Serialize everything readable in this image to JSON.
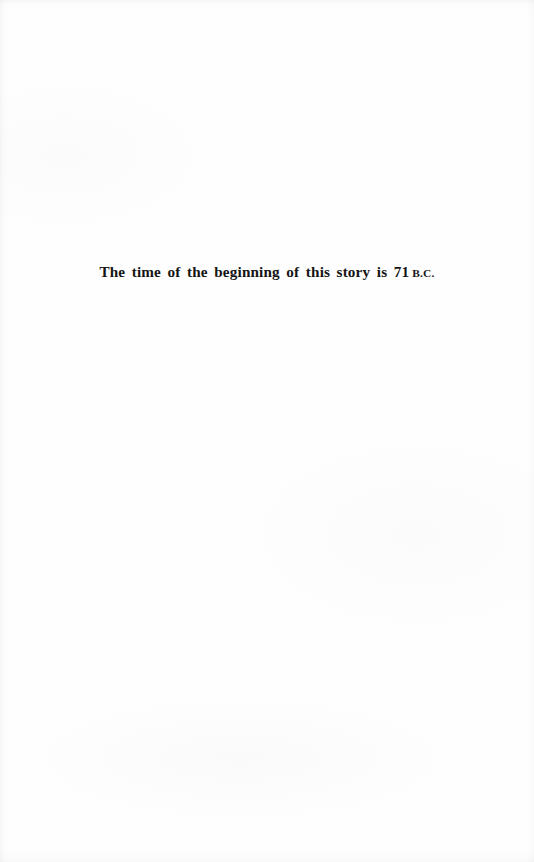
{
  "page": {
    "kind": "scanned-book-page",
    "background_color": "#fefefe",
    "ink_color": "#151515",
    "width": 534,
    "height": 862
  },
  "epigraph": {
    "full_text": "The time of the beginning of this story is 71 B.C.",
    "main_text": "The time of the beginning of this story is 71",
    "era_abbreviation": "B.C.",
    "alignment": "center",
    "baseline_y": 287
  }
}
